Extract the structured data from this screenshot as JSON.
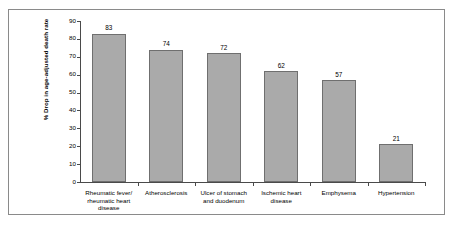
{
  "chart_data": {
    "type": "bar",
    "title": "",
    "xlabel": "",
    "ylabel": "% Drop in age-adjusted death rate",
    "ylim": [
      0,
      90
    ],
    "yticks": [
      0,
      10,
      20,
      30,
      40,
      50,
      60,
      70,
      80,
      90
    ],
    "grid": false,
    "legend": "none",
    "categories": [
      "Rheumatic fever/ rheumatic heart disease",
      "Atherosclerosis",
      "Ulcer of stomach and duodenum",
      "Ischemic heart disease",
      "Emphysema",
      "Hypertension"
    ],
    "category_lines": [
      [
        "Rheumatic fever/",
        "rheumatic heart",
        "disease"
      ],
      [
        "Atherosclerosis"
      ],
      [
        "Ulcer of stomach",
        "and duodenum"
      ],
      [
        "Ischemic heart",
        "disease"
      ],
      [
        "Emphysema"
      ],
      [
        "Hypertension"
      ]
    ],
    "values": [
      83,
      74,
      72,
      62,
      57,
      21
    ],
    "value_labels": [
      "83",
      "74",
      "72",
      "62",
      "57",
      "21"
    ],
    "colors": {
      "bar_fill": "#aaaaaa",
      "bar_border": "#6f6f6f",
      "axis": "#4a4a4a",
      "frame": "#8a8a8a",
      "text": "#000000",
      "background": "#ffffff"
    }
  }
}
